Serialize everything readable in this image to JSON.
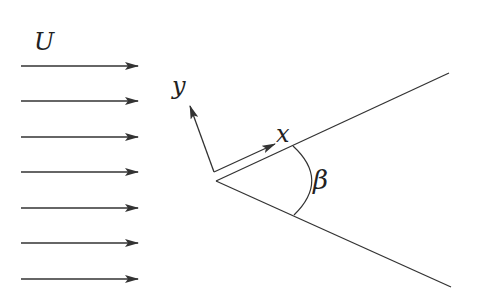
{
  "diagram": {
    "type": "flow-over-wedge",
    "colors": {
      "stroke": "#333333",
      "text": "#222222",
      "background": "#ffffff"
    },
    "freestream": {
      "label": "U",
      "label_pos": [
        53,
        50
      ],
      "arrow_count": 7,
      "x_start": 21,
      "x_end": 138,
      "y_positions": [
        66,
        101,
        137,
        172,
        208,
        243,
        279
      ]
    },
    "wedge": {
      "apex": [
        216,
        181
      ],
      "upper_end": [
        449,
        73
      ],
      "lower_end": [
        451,
        287
      ]
    },
    "axes": {
      "origin": [
        214,
        172
      ],
      "x_axis": {
        "label": "x",
        "end": [
          275,
          144
        ],
        "label_pos": [
          284,
          142
        ]
      },
      "y_axis": {
        "label": "y",
        "end": [
          190,
          106
        ],
        "label_pos": [
          180,
          94
        ]
      }
    },
    "angle": {
      "label": "β",
      "label_pos": [
        322,
        189
      ],
      "arc_start": [
        293,
        146
      ],
      "arc_end": [
        294,
        215
      ],
      "arc_control": [
        330,
        180
      ]
    }
  }
}
